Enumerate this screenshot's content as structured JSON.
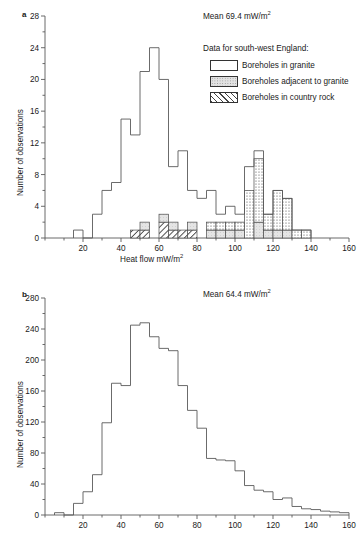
{
  "figure": {
    "y_axis_label": "Number of observations",
    "x_axis_label_main": "Heat flow mW/m",
    "x_axis_label_sup": "2"
  },
  "panel_a": {
    "letter": "a",
    "mean_text_main": "Mean 69.4 mW/m",
    "mean_text_sup": "2",
    "legend_title": "Data for south-west England:",
    "legend": [
      {
        "key": "granite",
        "label": "Boreholes in granite",
        "swatch": "dotted-dense",
        "color": "#ffffff"
      },
      {
        "key": "adjacent",
        "label": "Boreholes adjacent to granite",
        "swatch": "stipple-light",
        "color": "#e2e2e2"
      },
      {
        "key": "country",
        "label": "Boreholes in country rock",
        "swatch": "diagonal-hatch",
        "color": "#ffffff"
      }
    ]
  },
  "panel_b": {
    "letter": "b",
    "mean_text_main": "Mean 64.4 mW/m",
    "mean_text_sup": "2"
  },
  "chart_data": [
    {
      "type": "bar",
      "panel": "a",
      "title": "Heat flow histogram - UK with south-west England breakdown",
      "xlabel": "Heat flow mW/m2",
      "ylabel": "Number of observations",
      "xlim": [
        0,
        160
      ],
      "ylim": [
        0,
        28
      ],
      "xticks": [
        0,
        20,
        40,
        60,
        80,
        100,
        120,
        140,
        160
      ],
      "yticks": [
        0,
        4,
        8,
        12,
        16,
        20,
        24,
        28
      ],
      "minor_ytick_step": 2,
      "minor_xtick_step": 10,
      "bin_width": 5,
      "grid": false,
      "legend_position": "upper-right",
      "stacked": true,
      "bin_starts": [
        15,
        20,
        25,
        30,
        35,
        40,
        45,
        50,
        55,
        60,
        65,
        70,
        75,
        80,
        85,
        90,
        95,
        100,
        105,
        110,
        115,
        120,
        125,
        130,
        135
      ],
      "series": [
        {
          "name": "Total (all observations)",
          "values": [
            1,
            0,
            3,
            6,
            7,
            15,
            13,
            21,
            24,
            20,
            9,
            11,
            6,
            5,
            6,
            3,
            4,
            3,
            9,
            11,
            3,
            6,
            5,
            1,
            1
          ]
        },
        {
          "name": "Boreholes in granite",
          "values": [
            0,
            0,
            0,
            0,
            0,
            0,
            0,
            0,
            0,
            0,
            0,
            0,
            0,
            0,
            1,
            1,
            1,
            1,
            6,
            8,
            2,
            5,
            4,
            1,
            1
          ]
        },
        {
          "name": "Boreholes adjacent to granite",
          "values": [
            0,
            0,
            0,
            0,
            0,
            0,
            0,
            1,
            0,
            1,
            1,
            0,
            1,
            0,
            1,
            1,
            1,
            1,
            0,
            2,
            1,
            1,
            1,
            0,
            0
          ]
        },
        {
          "name": "Boreholes in country rock",
          "values": [
            0,
            0,
            0,
            0,
            0,
            0,
            1,
            1,
            0,
            2,
            1,
            1,
            1,
            0,
            0,
            0,
            0,
            0,
            0,
            0,
            0,
            0,
            0,
            0,
            0
          ]
        }
      ]
    },
    {
      "type": "bar",
      "panel": "b",
      "title": "Heat flow histogram - global dataset",
      "xlabel": "Heat flow mW/m2",
      "ylabel": "Number of observations",
      "xlim": [
        0,
        160
      ],
      "ylim": [
        0,
        280
      ],
      "xticks": [
        0,
        20,
        40,
        60,
        80,
        100,
        120,
        140,
        160
      ],
      "yticks": [
        0,
        40,
        80,
        120,
        160,
        200,
        240,
        280
      ],
      "minor_ytick_step": 20,
      "minor_xtick_step": 10,
      "bin_width": 5,
      "grid": false,
      "stacked": false,
      "bin_starts": [
        5,
        10,
        15,
        20,
        25,
        30,
        35,
        40,
        45,
        50,
        55,
        60,
        65,
        70,
        75,
        80,
        85,
        90,
        95,
        100,
        105,
        110,
        115,
        120,
        125,
        130,
        135,
        140,
        145,
        150,
        155
      ],
      "values": [
        3,
        0,
        15,
        30,
        52,
        119,
        170,
        167,
        245,
        248,
        230,
        215,
        212,
        167,
        135,
        112,
        73,
        71,
        70,
        57,
        38,
        32,
        30,
        20,
        22,
        11,
        8,
        7,
        5,
        4,
        3
      ]
    }
  ]
}
